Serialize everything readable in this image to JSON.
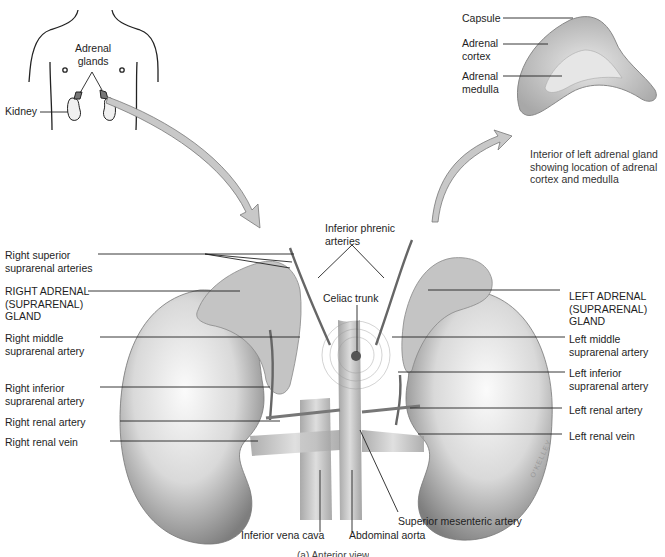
{
  "figure": {
    "bottom_caption": "(a) Anterior view",
    "signature": "O'KELLEY"
  },
  "inset_body": {
    "labels": {
      "adrenal_glands": "Adrenal\nglands",
      "kidney": "Kidney"
    }
  },
  "inset_section": {
    "labels": {
      "capsule": "Capsule",
      "adrenal_cortex": "Adrenal\ncortex",
      "adrenal_medulla": "Adrenal\nmedulla"
    },
    "caption": "Interior of left adrenal gland\nshowing location of adrenal\ncortex and medulla"
  },
  "main": {
    "left_labels": [
      "Right superior\nsuprarenal arteries",
      "RIGHT ADRENAL\n(SUPRARENAL)\nGLAND",
      "Right middle\nsuprarenal artery",
      "Right inferior\nsuprarenal artery",
      "Right renal artery",
      "Right renal vein"
    ],
    "right_labels": [
      "LEFT ADRENAL\n(SUPRARENAL)\nGLAND",
      "Left middle\nsuprarenal artery",
      "Left inferior\nsuprarenal artery",
      "Left renal artery",
      "Left renal vein"
    ],
    "top_labels": {
      "inferior_phrenic": "Inferior phrenic\narteries",
      "celiac_trunk": "Celiac trunk"
    },
    "bottom_labels": {
      "ivc": "Inferior vena cava",
      "aorta": "Abdominal aorta",
      "sma": "Superior mesenteric artery"
    }
  },
  "colors": {
    "line": "#2a2a2a",
    "arrow_fill": "#c8c8c8",
    "kidney_dark": "#8a8a8a",
    "kidney_light": "#f4f4f4",
    "gland": "#b9b9b9"
  }
}
